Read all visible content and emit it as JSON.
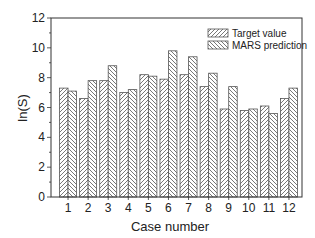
{
  "chart_data": {
    "type": "bar",
    "title": "",
    "xlabel": "Case number",
    "ylabel": "ln(S)",
    "ylim": [
      0,
      12
    ],
    "yticks": [
      0,
      2,
      4,
      6,
      8,
      10,
      12
    ],
    "grid": false,
    "legend_position": "top-right",
    "categories": [
      "1",
      "2",
      "3",
      "4",
      "5",
      "6",
      "7",
      "8",
      "9",
      "10",
      "11",
      "12"
    ],
    "series": [
      {
        "name": "Target value",
        "pattern": "forward-hatch",
        "values": [
          7.3,
          6.6,
          7.8,
          7.0,
          8.2,
          7.9,
          8.2,
          7.4,
          5.9,
          5.8,
          6.1,
          6.6
        ]
      },
      {
        "name": "MARS prediction",
        "pattern": "back-hatch",
        "values": [
          7.1,
          7.8,
          8.8,
          7.2,
          8.1,
          9.8,
          9.4,
          8.3,
          7.4,
          5.9,
          5.6,
          7.3
        ]
      }
    ]
  }
}
